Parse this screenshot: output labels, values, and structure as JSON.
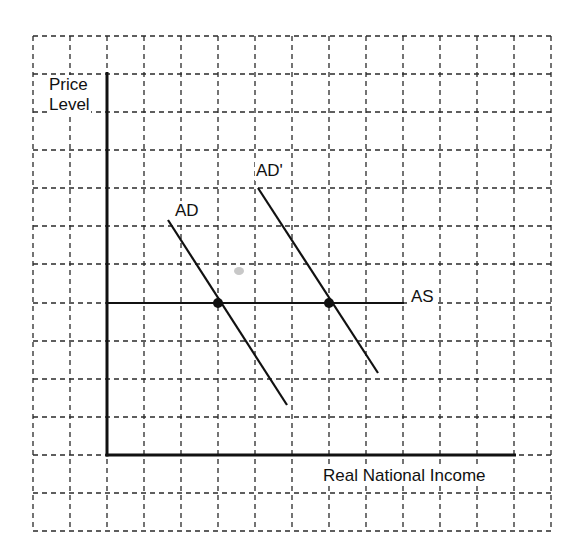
{
  "diagram": {
    "type": "economics-ad-as",
    "title": "",
    "canvas": {
      "width": 585,
      "height": 554
    },
    "colors": {
      "ink": "#111111",
      "grid": "#2a2a2a",
      "background": "#ffffff",
      "smudge": "#c8c8c8"
    },
    "grid": {
      "x_lines": [
        33,
        70,
        107,
        144,
        181,
        218,
        255,
        292,
        329,
        366,
        403,
        440,
        477,
        514,
        551
      ],
      "y_lines": [
        36,
        74,
        112,
        150,
        188,
        226,
        264,
        303,
        341,
        379,
        417,
        455,
        493,
        531
      ],
      "left": 33,
      "right": 551,
      "top": 36,
      "bottom": 531
    },
    "axes": {
      "y_axis": {
        "x": 107,
        "y_top": 72,
        "y_bottom": 455,
        "label_line1": "Price",
        "label_line2": "Level"
      },
      "x_axis": {
        "y": 455,
        "x_left": 107,
        "x_right": 516,
        "label": "Real National Income"
      }
    },
    "curves": [
      {
        "id": "AS",
        "label": "AS",
        "x1": 107,
        "y1": 303,
        "x2": 404,
        "y2": 303
      },
      {
        "id": "AD",
        "label": "AD",
        "x1": 168,
        "y1": 220,
        "x2": 287,
        "y2": 405
      },
      {
        "id": "AD_prime",
        "label": "AD'",
        "x1": 258,
        "y1": 188,
        "x2": 378,
        "y2": 373
      }
    ],
    "equilibrium_points": [
      {
        "id": "E1",
        "x": 218,
        "y": 303,
        "r": 5,
        "between": "AD and AS"
      },
      {
        "id": "E2",
        "x": 329,
        "y": 303,
        "r": 5,
        "between": "AD' and AS"
      }
    ],
    "labels": {
      "price": "Price",
      "level": "Level",
      "ad": "AD",
      "ad_prime": "AD'",
      "as": "AS",
      "x_axis": "Real National Income"
    }
  }
}
